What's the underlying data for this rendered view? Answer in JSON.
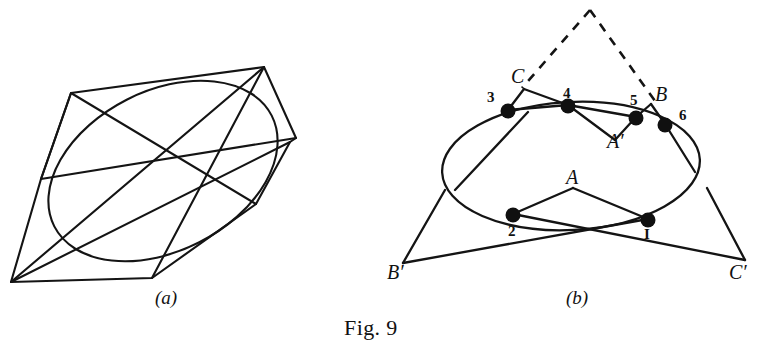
{
  "figure": {
    "caption": "Fig. 9",
    "panels": [
      {
        "id": "a",
        "sub_caption": "(a)",
        "description": "ellipse inscribed in a polygon with crossing chords"
      },
      {
        "id": "b",
        "sub_caption": "(b)",
        "description": "ellipse with hexagon 1-2-3-4-5-6 and Pascal line points A, B, C, A', B', C'"
      }
    ]
  },
  "panel_a": {
    "sub_caption": "(a)"
  },
  "panel_b": {
    "sub_caption": "(b)",
    "point_labels": {
      "p3": "3",
      "p4": "4",
      "p5": "5",
      "p6": "6",
      "p2": "2",
      "p1": "I",
      "A": "A",
      "B": "B",
      "C": "C",
      "Aprime": "A′",
      "Bprime": "B′",
      "Cprime": "C′"
    }
  },
  "colors": {
    "ink": "#111111",
    "paper": "#ffffff"
  }
}
